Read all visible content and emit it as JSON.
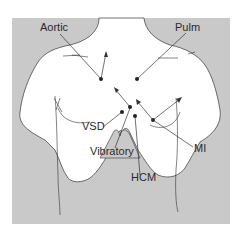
{
  "figure": {
    "background_color": "#c8c8c8",
    "body_color": "#ffffff",
    "line_color": "#333333"
  },
  "labels": {
    "aortic": "Aortic",
    "pulm": "Pulm",
    "vsd": "VSD",
    "vibratory": "Vibratory",
    "hcm": "HCM",
    "mi": "MI"
  }
}
